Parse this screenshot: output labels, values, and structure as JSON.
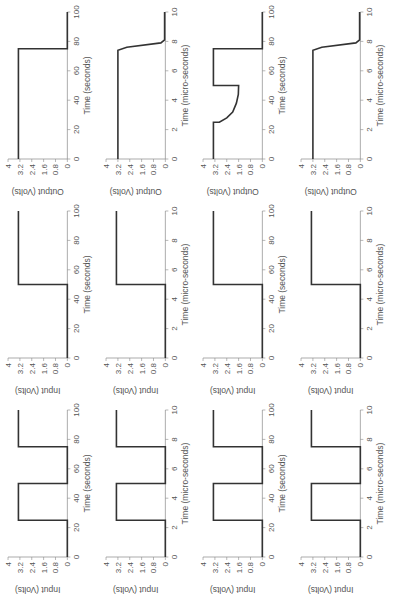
{
  "figure": {
    "caption": "",
    "line_color": "#333333",
    "axis_color": "#888888"
  },
  "chart_data": [
    {
      "id": "r1c1",
      "type": "line",
      "ylabel": "Input (Volts)",
      "xlabel": "Time (micro-seconds)",
      "xlim": [
        0,
        10
      ],
      "ylim": [
        0,
        4
      ],
      "xticks": [
        0,
        2,
        4,
        6,
        8,
        10
      ],
      "yticks": [
        0,
        0.8,
        1.6,
        2.4,
        3.2,
        4
      ],
      "x": [
        0,
        2.5,
        2.5,
        5,
        5,
        7.5,
        7.5,
        10
      ],
      "y": [
        0,
        0,
        3.3,
        3.3,
        0,
        0,
        3.3,
        3.3
      ]
    },
    {
      "id": "r1c2",
      "type": "line",
      "ylabel": "Input (Volts)",
      "xlabel": "Time (seconds)",
      "xlim": [
        0,
        100
      ],
      "ylim": [
        0,
        4
      ],
      "xticks": [
        0,
        20,
        40,
        60,
        80,
        100
      ],
      "yticks": [
        0,
        0.8,
        1.6,
        2.4,
        3.2,
        4
      ],
      "x": [
        0,
        25,
        25,
        50,
        50,
        75,
        75,
        100
      ],
      "y": [
        0,
        0,
        3.3,
        3.3,
        0,
        0,
        3.3,
        3.3
      ]
    },
    {
      "id": "r1c3",
      "type": "line",
      "ylabel": "Input (Volts)",
      "xlabel": "Time (micro-seconds)",
      "xlim": [
        0,
        10
      ],
      "ylim": [
        0,
        4
      ],
      "xticks": [
        0,
        2,
        4,
        6,
        8,
        10
      ],
      "yticks": [
        0,
        0.8,
        1.6,
        2.4,
        3.2,
        4
      ],
      "x": [
        0,
        2.5,
        2.5,
        5,
        5,
        7.5,
        7.5,
        10
      ],
      "y": [
        0,
        0,
        3.3,
        3.3,
        0,
        0,
        3.3,
        3.3
      ]
    },
    {
      "id": "r1c4",
      "type": "line",
      "ylabel": "Input (Volts)",
      "xlabel": "Time (seconds)",
      "xlim": [
        0,
        100
      ],
      "ylim": [
        0,
        4
      ],
      "xticks": [
        0,
        20,
        40,
        60,
        80,
        100
      ],
      "yticks": [
        0,
        0.8,
        1.6,
        2.4,
        3.2,
        4
      ],
      "x": [
        0,
        25,
        25,
        50,
        50,
        75,
        75,
        100
      ],
      "y": [
        0,
        0,
        3.3,
        3.3,
        0,
        0,
        3.3,
        3.3
      ]
    },
    {
      "id": "r2c1",
      "type": "line",
      "ylabel": "Input (Volts)",
      "xlabel": "Time (micro-seconds)",
      "xlim": [
        0,
        10
      ],
      "ylim": [
        0,
        4
      ],
      "xticks": [
        0,
        2,
        4,
        6,
        8,
        10
      ],
      "yticks": [
        0,
        0.8,
        1.6,
        2.4,
        3.2,
        4
      ],
      "x": [
        0,
        5,
        5,
        10
      ],
      "y": [
        0,
        0,
        3.3,
        3.3
      ]
    },
    {
      "id": "r2c2",
      "type": "line",
      "ylabel": "Input (Volts)",
      "xlabel": "Time (seconds)",
      "xlim": [
        0,
        100
      ],
      "ylim": [
        0,
        4
      ],
      "xticks": [
        0,
        20,
        40,
        60,
        80,
        100
      ],
      "yticks": [
        0,
        0.8,
        1.6,
        2.4,
        3.2,
        4
      ],
      "x": [
        0,
        50,
        50,
        100
      ],
      "y": [
        0,
        0,
        3.3,
        3.3
      ]
    },
    {
      "id": "r2c3",
      "type": "line",
      "ylabel": "Input (Volts)",
      "xlabel": "Time (micro-seconds)",
      "xlim": [
        0,
        10
      ],
      "ylim": [
        0,
        4
      ],
      "xticks": [
        0,
        2,
        4,
        6,
        8,
        10
      ],
      "yticks": [
        0,
        0.8,
        1.6,
        2.4,
        3.2,
        4
      ],
      "x": [
        0,
        5,
        5,
        10
      ],
      "y": [
        0,
        0,
        3.3,
        3.3
      ]
    },
    {
      "id": "r2c4",
      "type": "line",
      "ylabel": "Input (Volts)",
      "xlabel": "Time (seconds)",
      "xlim": [
        0,
        100
      ],
      "ylim": [
        0,
        4
      ],
      "xticks": [
        0,
        20,
        40,
        60,
        80,
        100
      ],
      "yticks": [
        0,
        0.8,
        1.6,
        2.4,
        3.2,
        4
      ],
      "x": [
        0,
        50,
        50,
        100
      ],
      "y": [
        0,
        0,
        3.3,
        3.3
      ]
    },
    {
      "id": "r3c1",
      "type": "line",
      "ylabel": "Output (Volts)",
      "xlabel": "Time (micro-seconds)",
      "xlim": [
        0,
        10
      ],
      "ylim": [
        0,
        4
      ],
      "xticks": [
        0,
        2,
        4,
        6,
        8,
        10
      ],
      "yticks": [
        0,
        0.8,
        1.6,
        2.4,
        3.2,
        4
      ],
      "x": [
        0,
        7.4,
        7.6,
        7.9,
        8.1,
        10
      ],
      "y": [
        3.2,
        3.2,
        2.6,
        0.3,
        0.05,
        0.05
      ]
    },
    {
      "id": "r3c2",
      "type": "line",
      "ylabel": "Output (Volts)",
      "xlabel": "Time (seconds)",
      "xlim": [
        0,
        100
      ],
      "ylim": [
        0,
        4
      ],
      "xticks": [
        0,
        20,
        40,
        60,
        80,
        100
      ],
      "yticks": [
        0,
        0.8,
        1.6,
        2.4,
        3.2,
        4
      ],
      "x": [
        0,
        25,
        25,
        28,
        32,
        38,
        44,
        50,
        50,
        75,
        75,
        100
      ],
      "y": [
        3.3,
        3.3,
        2.9,
        2.4,
        2.0,
        1.75,
        1.62,
        1.6,
        3.3,
        3.3,
        0,
        0
      ]
    },
    {
      "id": "r3c3",
      "type": "line",
      "ylabel": "Output (Volts)",
      "xlabel": "Time (micro-seconds)",
      "xlim": [
        0,
        10
      ],
      "ylim": [
        0,
        4
      ],
      "xticks": [
        0,
        2,
        4,
        6,
        8,
        10
      ],
      "yticks": [
        0,
        0.8,
        1.6,
        2.4,
        3.2,
        4
      ],
      "x": [
        0,
        7.4,
        7.6,
        7.9,
        8.1,
        10
      ],
      "y": [
        3.2,
        3.2,
        2.6,
        0.3,
        0.05,
        0.05
      ]
    },
    {
      "id": "r3c4",
      "type": "line",
      "ylabel": "Output (Volts)",
      "xlabel": "Time (seconds)",
      "xlim": [
        0,
        100
      ],
      "ylim": [
        0,
        4
      ],
      "xticks": [
        0,
        20,
        40,
        60,
        80,
        100
      ],
      "yticks": [
        0,
        0.8,
        1.6,
        2.4,
        3.2,
        4
      ],
      "x": [
        0,
        75,
        75,
        100
      ],
      "y": [
        3.3,
        3.3,
        0,
        0
      ]
    }
  ]
}
